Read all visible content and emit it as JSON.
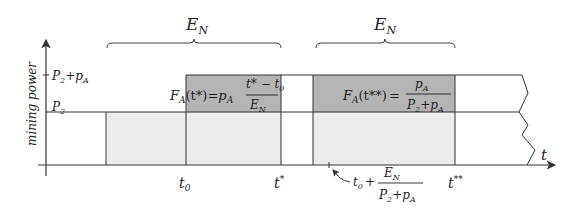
{
  "diagram": {
    "y_axis_label": "mining power",
    "x_axis_label": "t",
    "y_ticks": [
      {
        "label_main": "P",
        "label_sub": "2",
        "label_rest": "+p",
        "label_rest_sub": "A",
        "full": "P2+pA"
      },
      {
        "label_main": "P",
        "label_sub": "2",
        "full": "P2"
      }
    ],
    "x_ticks": {
      "t0": {
        "main": "t",
        "sub": "0"
      },
      "tstar": {
        "main": "t",
        "sup": "*"
      },
      "tstarstar": {
        "main": "t",
        "sup": "**"
      }
    },
    "braces": [
      {
        "label_main": "E",
        "label_sub": "N"
      },
      {
        "label_main": "E",
        "label_sub": "N"
      }
    ],
    "formula1": {
      "lhs": "F",
      "lhs_sub": "A",
      "lhs_arg": "(t*)",
      "eq": "=",
      "coef": "p",
      "coef_sub": "A",
      "num": "t* − t",
      "num_sub": "0",
      "den": "E",
      "den_sub": "N",
      "full": "F_A(t*) = p_A (t* − t_0) / E_N"
    },
    "formula2": {
      "lhs": "F",
      "lhs_sub": "A",
      "lhs_arg": "(t**)",
      "eq": "=",
      "num": "p",
      "num_sub": "A",
      "den": "P",
      "den_sub": "2",
      "den_rest": "+p",
      "den_rest_sub": "A",
      "full": "F_A(t**) = p_A / (P_2 + p_A)"
    },
    "annotation": {
      "t": "t",
      "t_sub": "0",
      "plus": "+",
      "num": "E",
      "num_sub": "N",
      "den": "P",
      "den_sub": "2",
      "den_rest": "+p",
      "den_rest_sub": "A",
      "full": "t_0 + E_N / (P_2 + p_A)"
    },
    "colors": {
      "light_fill": "#ececec",
      "dark_fill": "#b4b4b4",
      "line": "#333333"
    }
  }
}
